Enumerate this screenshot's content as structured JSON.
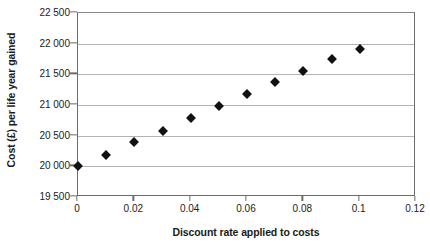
{
  "chart_data": {
    "type": "scatter",
    "title": "",
    "xlabel": "Discount rate applied to costs",
    "ylabel": "Cost (£) per life year gained",
    "xlim": [
      0,
      0.12
    ],
    "ylim": [
      19500,
      22500
    ],
    "grid": true,
    "legend": false,
    "legend_position": "none",
    "marker": "diamond",
    "marker_color": "#111111",
    "gridline_color": "#b3b3b3",
    "axis_color": "#6b6b6b",
    "x": [
      0,
      0.01,
      0.02,
      0.03,
      0.04,
      0.05,
      0.06,
      0.07,
      0.08,
      0.09,
      0.1
    ],
    "values": [
      20000,
      20190,
      20390,
      20580,
      20790,
      20990,
      21180,
      21380,
      21550,
      21750,
      21920
    ],
    "xticks": [
      0,
      0.02,
      0.04,
      0.06,
      0.08,
      0.1,
      0.12
    ],
    "xtick_labels": [
      "0",
      "0.02",
      "0.04",
      "0.06",
      "0.08",
      "0.1",
      "0.12"
    ],
    "yticks": [
      19500,
      20000,
      20500,
      21000,
      21500,
      22000,
      22500
    ],
    "ytick_labels": [
      "19 500",
      "20 000",
      "20 500",
      "21 000",
      "21 500",
      "22 000",
      "22 500"
    ]
  }
}
